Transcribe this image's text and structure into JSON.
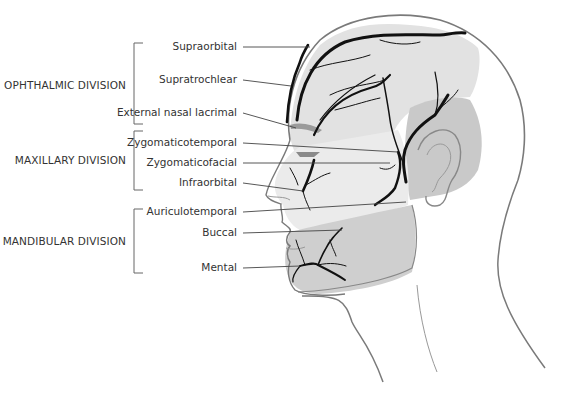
{
  "diagram": {
    "divisions": [
      {
        "label": "OPHTHALMIC DIVISION",
        "nerves": [
          "Supraorbital",
          "Supratrochlear",
          "External nasal lacrimal"
        ]
      },
      {
        "label": "MAXILLARY DIVISION",
        "nerves": [
          "Zygomaticotemporal",
          "Zygomaticofacial",
          "Infraorbital"
        ]
      },
      {
        "label": "MANDIBULAR DIVISION",
        "nerves": [
          "Auriculotemporal",
          "Buccal",
          "Mental"
        ]
      }
    ],
    "colors": {
      "ophthalmic_region": "#e2e2e2",
      "maxillary_region": "#ebebeb",
      "mandibular_region": "#cfcfcf",
      "temporal_region": "#c9c9c9",
      "nerve": "#111111",
      "outline": "#7a7a7a",
      "leader_line": "#444444"
    }
  }
}
